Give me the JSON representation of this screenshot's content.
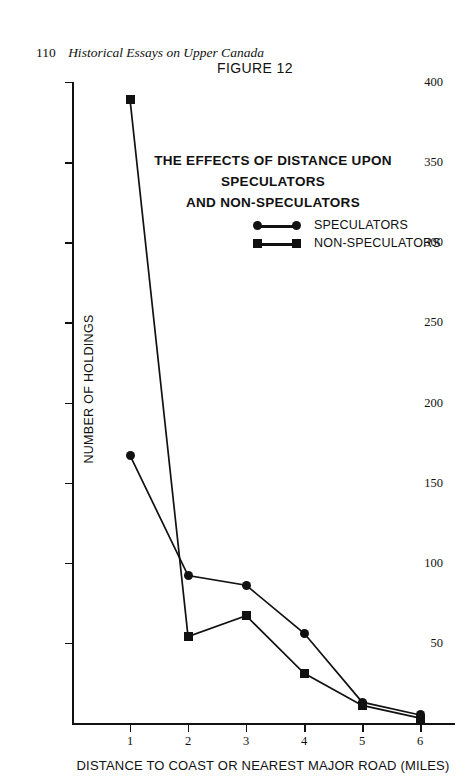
{
  "page": {
    "folio": "110",
    "running_title": "Historical Essays on Upper Canada"
  },
  "figure": {
    "number_label": "FIGURE 12",
    "title_line_1": "THE  EFFECTS OF DISTANCE UPON SPECULATORS",
    "title_line_2": "AND NON-SPECULATORS"
  },
  "chart_data": {
    "type": "line",
    "title": "THE EFFECTS OF DISTANCE UPON SPECULATORS AND NON-SPECULATORS",
    "subtitle": "FIGURE 12",
    "xlabel": "DISTANCE TO COAST OR NEAREST MAJOR ROAD (MILES)",
    "ylabel": "NUMBER OF HOLDINGS",
    "x": [
      1,
      2,
      3,
      4,
      5,
      6
    ],
    "xticklabels": [
      "1",
      "2",
      "3",
      "4",
      "5",
      "6"
    ],
    "yticks": [
      50,
      100,
      150,
      200,
      250,
      300,
      350,
      400
    ],
    "yticklabels": [
      "50",
      "100",
      "150",
      "200",
      "250",
      "300",
      "350",
      "400"
    ],
    "xlim": [
      0.0,
      6.6
    ],
    "ylim": [
      0,
      400
    ],
    "grid": false,
    "legend_position": "upper-center",
    "series": [
      {
        "name": "SPECULATORS",
        "marker": "circle",
        "color": "#111111",
        "values": [
          167,
          92,
          86,
          56,
          13,
          5
        ]
      },
      {
        "name": "NON-SPECULATORS",
        "marker": "square",
        "color": "#111111",
        "values": [
          389,
          54,
          67,
          31,
          11,
          3
        ]
      }
    ]
  }
}
